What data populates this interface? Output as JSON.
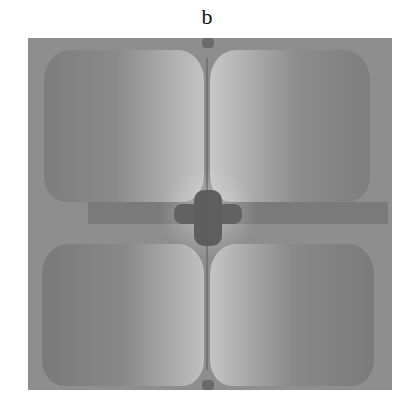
{
  "figure": {
    "caption": "b"
  }
}
